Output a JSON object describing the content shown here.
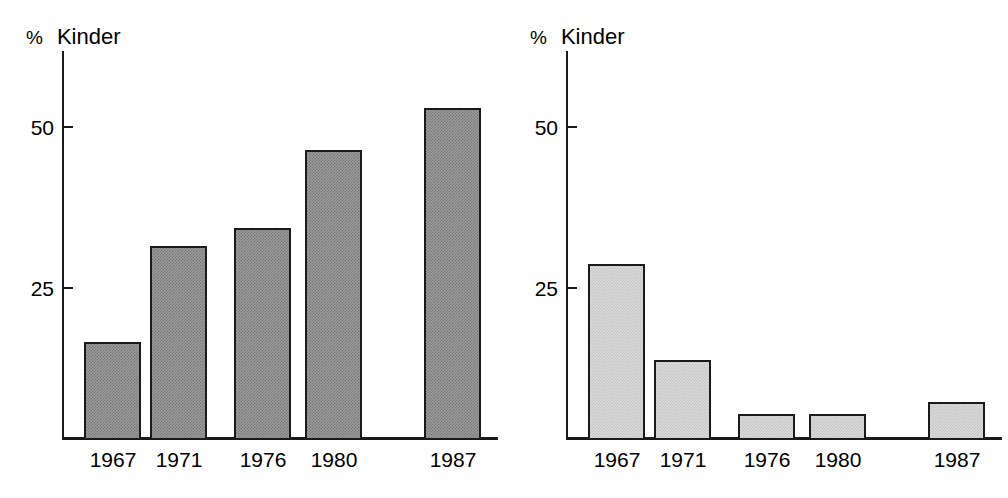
{
  "figure": {
    "background_color": "#ffffff",
    "panels": [
      {
        "id": "left",
        "unit_label": "%",
        "series_label": "Kinder",
        "bar_fill_color": "#9a9a9a",
        "bar_edge_color": "#1a1a1a"
      },
      {
        "id": "right",
        "unit_label": "%",
        "series_label": "Kinder",
        "bar_fill_color": "#dadada",
        "bar_edge_color": "#1a1a1a"
      }
    ]
  },
  "chart_data": [
    {
      "type": "bar",
      "title": "",
      "subtitle": "",
      "xlabel": "",
      "ylabel": "% Kinder",
      "categories": [
        "1967",
        "1971",
        "1976",
        "1980",
        "1987"
      ],
      "values": [
        16,
        32,
        35,
        48,
        55
      ],
      "yticks": [
        25,
        50
      ],
      "ytick_labels": [
        "25",
        "50"
      ],
      "ylim": [
        0,
        61
      ],
      "grid": false,
      "legend": "none",
      "bar_color": "#9a9a9a",
      "bar_edge_color": "#1a1a1a",
      "annotations": []
    },
    {
      "type": "bar",
      "title": "",
      "subtitle": "",
      "xlabel": "",
      "ylabel": "% Kinder",
      "categories": [
        "1967",
        "1971",
        "1976",
        "1980",
        "1987"
      ],
      "values": [
        29,
        13,
        4,
        4,
        6
      ],
      "yticks": [
        25,
        50
      ],
      "ytick_labels": [
        "25",
        "50"
      ],
      "ylim": [
        0,
        61
      ],
      "grid": false,
      "legend": "none",
      "bar_color": "#dadada",
      "bar_edge_color": "#1a1a1a",
      "annotations": []
    }
  ]
}
